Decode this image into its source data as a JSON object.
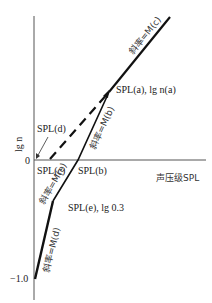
{
  "figure": {
    "type": "diagram"
  },
  "axes": {
    "y_label": "lg n",
    "x_label": "声压级SPL",
    "y_ticks": [
      "0",
      "−1.0"
    ]
  },
  "points": {
    "a": "SPL(a), lg n(a)",
    "b": "SPL(b)",
    "c": "SPL(c)",
    "d": "SPL(d)",
    "e": "SPL(e), lg 0.3"
  },
  "slopes": {
    "c": "斜率=M(c)",
    "b": "斜率=M(b)",
    "e": "斜率=M(e)",
    "d": "斜率=M(d)"
  },
  "colors": {
    "line": "#111111",
    "axis": "#555555",
    "text": "#222222"
  }
}
